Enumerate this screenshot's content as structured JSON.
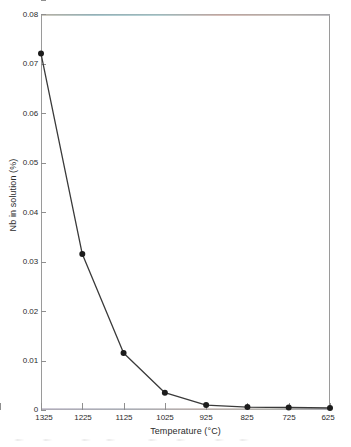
{
  "chart_data": {
    "type": "line",
    "title": "",
    "xlabel": "Temperature (°C)",
    "ylabel": "Nb in solution (%)",
    "x": [
      1325,
      1225,
      1125,
      1025,
      925,
      825,
      725,
      625
    ],
    "categories": [
      "1325",
      "1225",
      "1125",
      "1025",
      "925",
      "825",
      "725",
      "625"
    ],
    "values": [
      0.072,
      0.0315,
      0.0115,
      0.0035,
      0.001,
      0.0006,
      0.0005,
      0.0004
    ],
    "series": [
      {
        "name": "Nb in solution",
        "values": [
          0.072,
          0.0315,
          0.0115,
          0.0035,
          0.001,
          0.0006,
          0.0005,
          0.0004
        ]
      }
    ],
    "ylim": [
      0,
      0.08
    ],
    "xlim_labels": [
      "1325",
      "625"
    ],
    "x_axis_direction": "descending",
    "y_ticks": [
      0,
      0.01,
      0.02,
      0.03,
      0.04,
      0.05,
      0.06,
      0.07,
      0.08
    ],
    "y_tick_labels": [
      "0",
      "0.01",
      "0.02",
      "0.03",
      "0.04",
      "0.05",
      "0.06",
      "0.07",
      "0.08"
    ],
    "x_ticks": [
      1325,
      1225,
      1125,
      1025,
      925,
      825,
      725,
      625
    ],
    "x_tick_labels": [
      "1325",
      "1225",
      "1125",
      "1025",
      "925",
      "825",
      "725",
      "625"
    ],
    "grid": false,
    "legend": null,
    "legend_position": "none",
    "marker": "filled-circle",
    "line_color": "#3a3a3a",
    "marker_color": "#1c1c1c",
    "frame_color": "#9a9a9a",
    "background_color": "#ffffff",
    "text_color": "#2b2b2b"
  }
}
